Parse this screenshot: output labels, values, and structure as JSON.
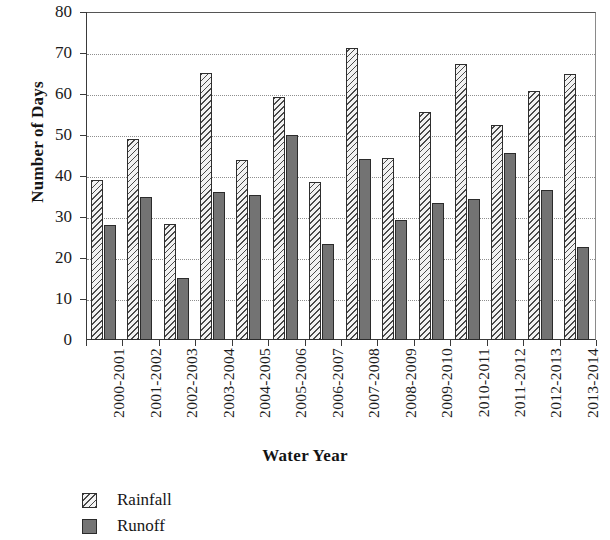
{
  "chart_data": {
    "type": "bar",
    "title": "",
    "xlabel": "Water Year",
    "ylabel": "Number of Days",
    "ylim": [
      0,
      80
    ],
    "ytick_step": 10,
    "yticks": [
      "0",
      "10",
      "20",
      "30",
      "40",
      "50",
      "60",
      "70",
      "80"
    ],
    "grid": true,
    "grid_style": "dotted-horizontal",
    "legend_position": "bottom-left",
    "categories": [
      "2000-2001",
      "2001-2002",
      "2002-2003",
      "2003-2004",
      "2004-2005",
      "2005-2006",
      "2006-2007",
      "2007-2008",
      "2008-2009",
      "2009-2010",
      "2010-2011",
      "2011-2012",
      "2012-2013",
      "2013-2014"
    ],
    "series": [
      {
        "name": "Rainfall",
        "pattern": "diagonal-hatch",
        "color": "#f2f2f2",
        "values": [
          39,
          49,
          28.2,
          65.2,
          44,
          59.3,
          38.5,
          71.3,
          44.3,
          55.5,
          67.2,
          52.5,
          60.7,
          64.8
        ]
      },
      {
        "name": "Runoff",
        "pattern": "solid",
        "color": "#737373",
        "values": [
          28,
          35,
          15.2,
          36.2,
          35.3,
          50.1,
          23.3,
          44.2,
          29.2,
          33.4,
          34.5,
          45.5,
          36.6,
          22.6
        ]
      }
    ]
  },
  "legend": {
    "items": [
      {
        "label": "Rainfall",
        "swatch": "hatched-square-icon"
      },
      {
        "label": "Runoff",
        "swatch": "filled-square-icon"
      }
    ]
  }
}
